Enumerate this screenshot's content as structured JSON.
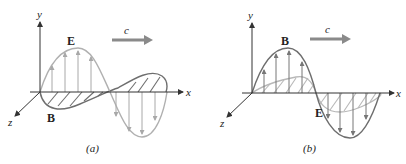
{
  "panels": [
    {
      "id": "a",
      "caption": "(a)",
      "axes": {
        "y": "y",
        "x": "x",
        "z": "z"
      },
      "vertical_wave_label": "E",
      "horizontal_wave_label": "B",
      "velocity_label": "c",
      "vertical_wave_color": "#b0b0b0",
      "horizontal_wave_color": "#6e6e6e"
    },
    {
      "id": "b",
      "caption": "(b)",
      "axes": {
        "y": "y",
        "x": "x",
        "z": "z"
      },
      "vertical_wave_label": "B",
      "horizontal_wave_label": "E",
      "velocity_label": "c",
      "vertical_wave_color": "#6e6e6e",
      "horizontal_wave_color": "#b8b8b8"
    }
  ],
  "colors": {
    "axis": "#333333",
    "arrow_c": "#8a8a8a"
  }
}
